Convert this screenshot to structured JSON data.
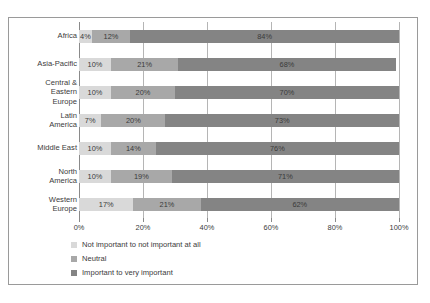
{
  "clipped_header_text": "",
  "chart_data": {
    "type": "bar",
    "orientation": "horizontal",
    "stacked": true,
    "stack_mode": "percent",
    "title": "",
    "subtitle": "",
    "xlabel": "",
    "ylabel": "",
    "xlim": [
      0,
      100
    ],
    "grid": true,
    "legend_position": "bottom-left",
    "xticks": [
      "0%",
      "20%",
      "40%",
      "60%",
      "80%",
      "100%"
    ],
    "xtick_values": [
      0,
      20,
      40,
      60,
      80,
      100
    ],
    "categories": [
      "Africa",
      "Asia-Pacific",
      "Central &\nEastern\nEurope",
      "Latin\nAmerica",
      "Middle East",
      "North\nAmerica",
      "Western\nEurope"
    ],
    "series": [
      {
        "name": "Not important to not important at all",
        "color": "#d9d9d9",
        "values": [
          4,
          10,
          10,
          7,
          10,
          10,
          17
        ],
        "labels": [
          "4%",
          "10%",
          "10%",
          "7%",
          "10%",
          "10%",
          "17%"
        ]
      },
      {
        "name": "Neutral",
        "color": "#a8a8a8",
        "values": [
          12,
          21,
          20,
          20,
          14,
          19,
          21
        ],
        "labels": [
          "12%",
          "21%",
          "20%",
          "20%",
          "14%",
          "19%",
          "21%"
        ]
      },
      {
        "name": "Important to very important",
        "color": "#848484",
        "values": [
          84,
          68,
          70,
          73,
          76,
          71,
          62
        ],
        "labels": [
          "84%",
          "68%",
          "70%",
          "73%",
          "76%",
          "71%",
          "62%"
        ]
      }
    ]
  }
}
